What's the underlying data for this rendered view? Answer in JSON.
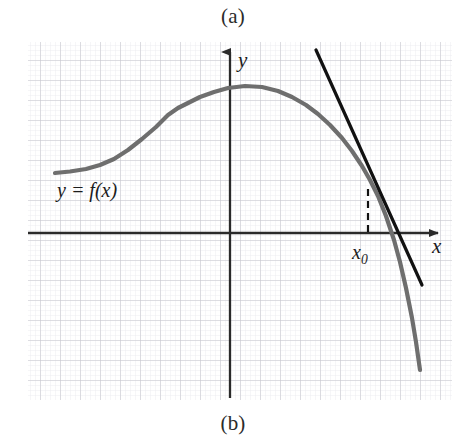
{
  "figure": {
    "panel_top_label": "(a)",
    "panel_bottom_label": "(b)",
    "background_color": "#ffffff"
  },
  "axes": {
    "x_label": "x",
    "y_label": "y",
    "axis_color": "#2a2a2a",
    "x_axis_y_px": 233,
    "y_axis_x_px": 230
  },
  "annotations": {
    "function_label": "y = f(x)",
    "point_label": "x",
    "point_label_sub": "0"
  },
  "grid": {
    "major_color": "#c9c9cf",
    "minor_color": "#e8e8ee",
    "major_step_px": 20,
    "minor_step_px": 5,
    "left_px": 28,
    "right_px": 452,
    "top_px": 42,
    "bottom_px": 400
  },
  "chart_data": {
    "type": "line",
    "title": "",
    "xlabel": "x",
    "ylabel": "y",
    "grid": true,
    "legend_position": "none",
    "annotations": [
      {
        "text": "y = f(x)",
        "x_px": 57,
        "y_px": 179
      },
      {
        "text": "x0",
        "x_px": 352,
        "y_px": 241
      }
    ],
    "series": [
      {
        "name": "f(x)",
        "color": "#6e6e6e",
        "width_px": 4.2,
        "points_px": [
          [
            55,
            173
          ],
          [
            70,
            171.5
          ],
          [
            86,
            169
          ],
          [
            100,
            165
          ],
          [
            114,
            159
          ],
          [
            128,
            150
          ],
          [
            142,
            139
          ],
          [
            156,
            127
          ],
          [
            168,
            115
          ],
          [
            178,
            108
          ],
          [
            188,
            103
          ],
          [
            200,
            97
          ],
          [
            214,
            92
          ],
          [
            228,
            88
          ],
          [
            245,
            86
          ],
          [
            262,
            87
          ],
          [
            278,
            91
          ],
          [
            292,
            97
          ],
          [
            306,
            105
          ],
          [
            318,
            114
          ],
          [
            330,
            125
          ],
          [
            342,
            138
          ],
          [
            352,
            151
          ],
          [
            362,
            166
          ],
          [
            370,
            180
          ],
          [
            378,
            196
          ],
          [
            386,
            216
          ],
          [
            394,
            240
          ],
          [
            400,
            262
          ],
          [
            406,
            288
          ],
          [
            412,
            318
          ],
          [
            416,
            342
          ],
          [
            420,
            370
          ]
        ]
      },
      {
        "name": "tangent-line",
        "color": "#111111",
        "width_px": 3.2,
        "points_px": [
          [
            316,
            50
          ],
          [
            422,
            285
          ]
        ]
      },
      {
        "name": "dashed-drop-line",
        "color": "#111111",
        "width_px": 2.2,
        "dashed": true,
        "points_px": [
          [
            368,
            189
          ],
          [
            368,
            233
          ]
        ]
      }
    ]
  }
}
